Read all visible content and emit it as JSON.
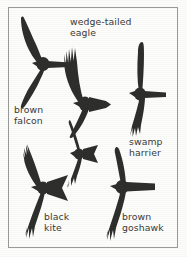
{
  "plate": {
    "kind": "raptor-flight-silhouette-identification-plate",
    "background_color": "#fdfdfb",
    "border_color": "#9a9a96",
    "silhouette_color": "#2e2e2c",
    "text_color": "#3a3a38"
  },
  "labels": {
    "wedge_tailed_eagle": "wedge-tailed\neagle",
    "brown_falcon": "brown\nfalcon",
    "swamp_harrier": "swamp\nharrier",
    "black_kite": "black\nkite",
    "brown_goshawk": "brown\ngoshawk"
  },
  "birds": [
    {
      "id": "brown-falcon",
      "label": "brown falcon",
      "wing_shape": "long, pointed, swept-back crescent",
      "tail_shape": "long, narrow, square-tipped",
      "tail_direction": "right"
    },
    {
      "id": "wedge-tailed-eagle",
      "label": "wedge-tailed eagle",
      "wing_shape": "long, broad, deeply fingered primaries",
      "tail_shape": "long wedge / diamond",
      "tail_direction": "right"
    },
    {
      "id": "swamp-harrier",
      "label": "swamp harrier",
      "wing_shape": "long, slim, fingered tips held in shallow V",
      "tail_shape": "long, narrow, square-tipped",
      "tail_direction": "right"
    },
    {
      "id": "black-kite",
      "label": "black kite",
      "wing_shape": "long, angled, fingered tips",
      "tail_shape": "forked / notched triangle",
      "tail_direction": "right"
    },
    {
      "id": "brown-goshawk",
      "label": "brown goshawk",
      "wing_shape": "short, broad, rounded",
      "tail_shape": "long, straight, square-tipped",
      "tail_direction": "right"
    },
    {
      "id": "unlabelled-upper-kite",
      "label": "",
      "wing_shape": "fingered, angled",
      "tail_shape": "notched",
      "tail_direction": "right"
    }
  ]
}
